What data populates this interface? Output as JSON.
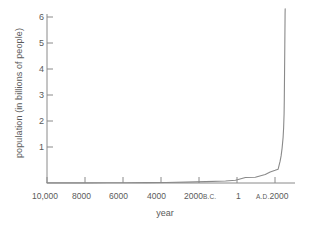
{
  "chart_data": {
    "type": "line",
    "title": "",
    "xlabel": "year",
    "ylabel": "population (in billions of people)",
    "ylim": [
      0,
      6.5
    ],
    "xlim": [
      -10000,
      2500
    ],
    "grid": false,
    "legend": null,
    "y_ticks": [
      "1",
      "2",
      "3",
      "4",
      "5",
      "6"
    ],
    "y_tick_values": [
      1,
      2,
      3,
      4,
      5,
      6
    ],
    "x_ticks": [
      {
        "label": "10,000",
        "era": "",
        "value": -10000
      },
      {
        "label": "8000",
        "era": "",
        "value": -8000
      },
      {
        "label": "6000",
        "era": "",
        "value": -6000
      },
      {
        "label": "4000",
        "era": "",
        "value": -4000
      },
      {
        "label": "2000",
        "era": "B.C.",
        "value": -2000
      },
      {
        "label": "1",
        "era": "",
        "value": 1
      },
      {
        "label": "2000",
        "era": "A.D.",
        "value": 2000
      }
    ],
    "series": [
      {
        "name": "world population",
        "x": [
          -10000,
          -9000,
          -8000,
          -7000,
          -6000,
          -5000,
          -4000,
          -3000,
          -2000,
          -1000,
          -500,
          1,
          500,
          1000,
          1250,
          1500,
          1650,
          1750,
          1800,
          1850,
          1900,
          1927,
          1950,
          1960,
          1974,
          1987,
          1999,
          2000,
          2005
        ],
        "values": [
          0.004,
          0.005,
          0.006,
          0.007,
          0.009,
          0.012,
          0.018,
          0.03,
          0.05,
          0.075,
          0.1,
          0.2,
          0.21,
          0.31,
          0.4,
          0.46,
          0.5,
          0.79,
          0.98,
          1.26,
          1.65,
          2.0,
          2.5,
          3.0,
          4.0,
          5.0,
          6.0,
          6.1,
          6.3
        ]
      }
    ],
    "annotation": "hockey-stick exponential growth curve; near-flat from 10,000 B.C. until roughly A.D. 1800, then near-vertical rise to about 6.2 billion"
  }
}
